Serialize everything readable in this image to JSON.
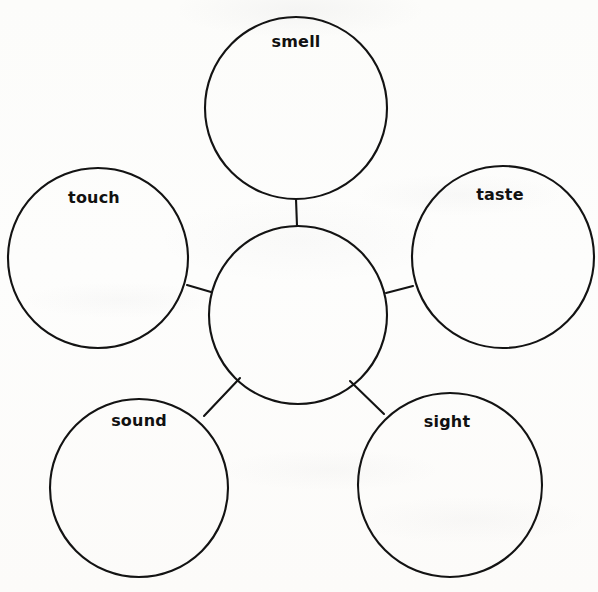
{
  "document": {
    "type": "worksheet-graphic-organizer",
    "organizer_style": "bubble-web",
    "title": "",
    "background_color": "#fdfdfb",
    "ink_color": "#131313"
  },
  "diagram": {
    "center_node": {
      "id": "center",
      "label": "",
      "is_blank": true,
      "cx": 298,
      "cy": 315,
      "r": 89
    },
    "nodes": [
      {
        "id": "smell",
        "label": "smell",
        "cx": 296,
        "cy": 108,
        "r": 91,
        "label_x": 296,
        "label_y": 41
      },
      {
        "id": "touch",
        "label": "touch",
        "cx": 98,
        "cy": 258,
        "r": 90,
        "label_x": 94,
        "label_y": 197
      },
      {
        "id": "taste",
        "label": "taste",
        "cx": 503,
        "cy": 257,
        "r": 91,
        "label_x": 500,
        "label_y": 194
      },
      {
        "id": "sound",
        "label": "sound",
        "cx": 139,
        "cy": 488,
        "r": 89,
        "label_x": 139,
        "label_y": 420
      },
      {
        "id": "sight",
        "label": "sight",
        "cx": 450,
        "cy": 485,
        "r": 92,
        "label_x": 447,
        "label_y": 421
      }
    ],
    "connectors": [
      {
        "id": "center-to-smell",
        "from": "center",
        "to": "smell",
        "x1": 297,
        "y1": 226,
        "x2": 296,
        "y2": 199
      },
      {
        "id": "center-to-touch",
        "from": "center",
        "to": "touch",
        "x1": 211,
        "y1": 292,
        "x2": 187,
        "y2": 285
      },
      {
        "id": "center-to-taste",
        "from": "center",
        "to": "taste",
        "x1": 386,
        "y1": 293,
        "x2": 413,
        "y2": 286
      },
      {
        "id": "center-to-sound",
        "from": "center",
        "to": "sound",
        "x1": 240,
        "y1": 378,
        "x2": 204,
        "y2": 416
      },
      {
        "id": "center-to-sight",
        "from": "center",
        "to": "sight",
        "x1": 350,
        "y1": 381,
        "x2": 384,
        "y2": 414
      }
    ]
  }
}
